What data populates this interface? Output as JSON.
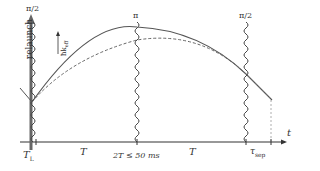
{
  "diagram": {
    "type": "atom-interferometer-timing-diagram",
    "pulses": [
      {
        "label": "π/2",
        "x": 33
      },
      {
        "label": "π",
        "x": 137
      },
      {
        "label": "π/2",
        "x": 246
      }
    ],
    "relaunch_label": "relaunch",
    "momentum_label": "ħk_eff",
    "axis": {
      "variable": "t",
      "ticks": [
        {
          "label": "T_L",
          "x": 33
        },
        {
          "label": "T",
          "x": 85
        },
        {
          "label": "2T ≤ 50 ms",
          "x": 137
        },
        {
          "label": "T",
          "x": 192
        },
        {
          "label": "τ_sep",
          "x": 246
        }
      ]
    },
    "trajectories": [
      {
        "style": "solid",
        "name": "upper arm"
      },
      {
        "style": "dashed",
        "name": "lower arm"
      }
    ],
    "colors": {
      "line": "#555555",
      "axis": "#333333",
      "relaunch_arrow": "#666666"
    }
  },
  "labels": {
    "pulse1": "π/2",
    "pulse2": "π",
    "pulse3": "π/2",
    "relaunch": "relaunch",
    "hk": "ħk",
    "hk_sub": "eff",
    "t": "t",
    "TL": "T",
    "TL_sub": "L",
    "T1": "T",
    "twoT": "2T ≤ 50 ms",
    "T2": "T",
    "tau": "τ",
    "tau_sub": "sep"
  }
}
